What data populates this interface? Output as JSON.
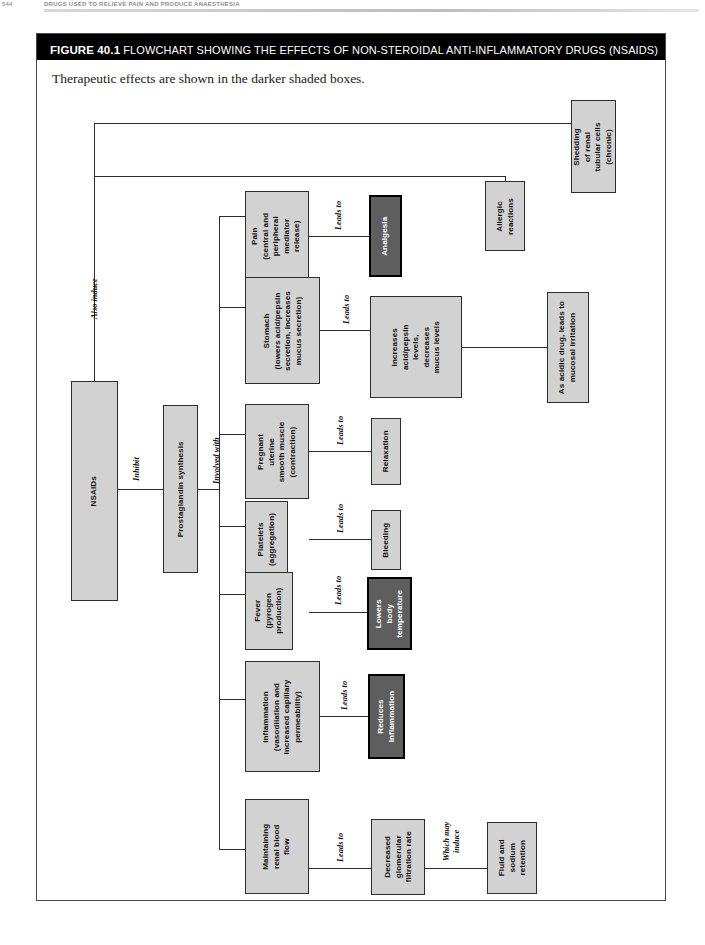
{
  "running_head": {
    "folio": "544",
    "title": "DRUGS USED TO RELIEVE PAIN AND PRODUCE ANAESTHESIA"
  },
  "figure": {
    "number_label": "FIGURE 40.1",
    "caption": "FLOWCHART SHOWING THE EFFECTS OF NON-STEROIDAL ANTI-INFLAMMATORY DRUGS (NSAIDS)",
    "subtitle": "Therapeutic effects are shown in the darker shaded boxes.",
    "colors": {
      "title_bar_bg": "#000000",
      "title_bar_text": "#ffffff",
      "node_fill": "#d2d2d2",
      "node_border": "#2d2d2d",
      "therapeutic_fill": "#5e5e5e",
      "therapeutic_text": "#ffffff",
      "frame_border": "#4a4a4a"
    }
  },
  "chart_data": {
    "type": "diagram",
    "title": "Flowchart showing the effects of non-steroidal anti-inflammatory drugs (NSAIDs)",
    "orientation": "left-to-right, text rotated 90 degrees counter-clockwise",
    "legend_note": "Therapeutic effects are shown in the darker shaded boxes.",
    "nodes": [
      {
        "id": "nsaids",
        "label": "NSAIDs",
        "style": "light"
      },
      {
        "id": "pg",
        "label": "Prostaglandin synthesis",
        "style": "light"
      },
      {
        "id": "pain",
        "label": "Pain\n(central and\nperipheral\nmediator\nrelease)",
        "style": "light"
      },
      {
        "id": "analgesia",
        "label": "Analgesia",
        "style": "dark"
      },
      {
        "id": "stomach",
        "label": "Stomach\n(lowers acid/pepsin\nsecretion, increases\nmucus secretion)",
        "style": "light"
      },
      {
        "id": "increases",
        "label": "Increases\nacid/pepsin\nlevels,\ndecreases\nmucus levels",
        "style": "light"
      },
      {
        "id": "acidic",
        "label": "As acidic drug, leads to\nmucosal irritation",
        "style": "light"
      },
      {
        "id": "uterine",
        "label": "Pregnant\nuterine\nsmooth muscle\n(contraction)",
        "style": "light"
      },
      {
        "id": "relaxation",
        "label": "Relaxation",
        "style": "light"
      },
      {
        "id": "platelets",
        "label": "Platelets\n(aggregation)",
        "style": "light"
      },
      {
        "id": "bleeding",
        "label": "Bleeding",
        "style": "light"
      },
      {
        "id": "fever",
        "label": "Fever\n(pyrogen\nproduction)",
        "style": "light"
      },
      {
        "id": "lowerstemp",
        "label": "Lowers\nbody\ntemperature",
        "style": "dark"
      },
      {
        "id": "inflammation",
        "label": "Inflammation\n(vasodilation and\nincreased capillary\npermeability)",
        "style": "light"
      },
      {
        "id": "reducesinflam",
        "label": "Reduces\ninflammation",
        "style": "dark"
      },
      {
        "id": "renalflow",
        "label": "Maintaining\nrenal blood\nflow",
        "style": "light"
      },
      {
        "id": "gfr",
        "label": "Decreased\nglomerular\nfiltration rate",
        "style": "light"
      },
      {
        "id": "fluid",
        "label": "Fluid and\nsodium\nretention",
        "style": "light"
      },
      {
        "id": "allergic",
        "label": "Allergic\nreactions",
        "style": "light"
      },
      {
        "id": "shedding",
        "label": "Shedding\nof renal\ntubular cells\n(chronic)",
        "style": "light"
      }
    ],
    "edges": [
      {
        "from": "nsaids",
        "to": "pg",
        "label": "Inhibit"
      },
      {
        "from": "pg",
        "to": "pain",
        "label": "Involved with"
      },
      {
        "from": "pg",
        "to": "stomach",
        "label": "Involved with"
      },
      {
        "from": "pg",
        "to": "uterine",
        "label": "Involved with"
      },
      {
        "from": "pg",
        "to": "platelets",
        "label": "Involved with"
      },
      {
        "from": "pg",
        "to": "fever",
        "label": "Involved with"
      },
      {
        "from": "pg",
        "to": "inflammation",
        "label": "Involved with"
      },
      {
        "from": "pg",
        "to": "renalflow",
        "label": "Involved with"
      },
      {
        "from": "pain",
        "to": "analgesia",
        "label": "Leads to"
      },
      {
        "from": "stomach",
        "to": "increases",
        "label": "Leads to"
      },
      {
        "from": "increases",
        "to": "acidic",
        "label": ""
      },
      {
        "from": "uterine",
        "to": "relaxation",
        "label": "Leads to"
      },
      {
        "from": "platelets",
        "to": "bleeding",
        "label": "Leads to"
      },
      {
        "from": "fever",
        "to": "lowerstemp",
        "label": "Leads to"
      },
      {
        "from": "inflammation",
        "to": "reducesinflam",
        "label": "Leads to"
      },
      {
        "from": "renalflow",
        "to": "gfr",
        "label": "Leads to"
      },
      {
        "from": "gfr",
        "to": "fluid",
        "label": "Which may induce"
      },
      {
        "from": "nsaids",
        "to": "allergic",
        "label": "Also induce"
      },
      {
        "from": "nsaids",
        "to": "shedding",
        "label": "Also induce"
      }
    ],
    "edge_labels": {
      "inhibit": "Inhibit",
      "involved_with": "Involved with",
      "leads_to": "Leads to",
      "which_may_induce": "Which may\ninduce",
      "also_induce": "Also induce"
    }
  }
}
